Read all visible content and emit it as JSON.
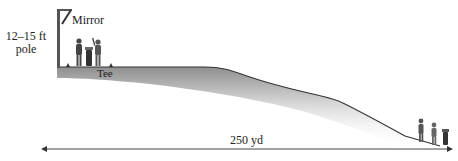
{
  "diagram": {
    "labels": {
      "pole_line1": "12–15 ft",
      "pole_line2": "pole",
      "mirror": "Mirror",
      "tee": "Tee",
      "distance": "250 yd"
    },
    "colors": {
      "ground_line": "#333333",
      "ground_shade": "#9a9a9a",
      "pole": "#555555",
      "text": "#222222",
      "arrow": "#333333"
    },
    "figures": {
      "tee_golfers": 2,
      "tee_bags": 1,
      "green_golfers": 2,
      "green_bags": 1
    }
  }
}
